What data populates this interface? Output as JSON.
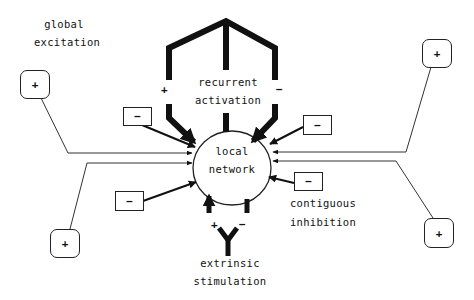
{
  "diagram": {
    "center_node": {
      "line1": "local",
      "line2": "network"
    },
    "recurrent": {
      "line1": "recurrent",
      "line2": "activation",
      "plus_sign": "+",
      "minus_sign": "−"
    },
    "global": {
      "line1": "global",
      "line2": "excitation"
    },
    "contiguous": {
      "line1": "contiguous",
      "line2": "inhibition"
    },
    "extrinsic": {
      "line1": "extrinsic",
      "line2": "stimulation",
      "plus_sign": "+",
      "minus_sign": "−"
    },
    "plus_boxes": [
      {
        "label": "+",
        "position": "top-left"
      },
      {
        "label": "+",
        "position": "bottom-left"
      },
      {
        "label": "+",
        "position": "top-right"
      },
      {
        "label": "+",
        "position": "bottom-right"
      }
    ],
    "minus_boxes": [
      {
        "label": "−",
        "position": "upper-left"
      },
      {
        "label": "−",
        "position": "lower-left"
      },
      {
        "label": "−",
        "position": "upper-right"
      },
      {
        "label": "−",
        "position": "lower-right"
      }
    ],
    "colors": {
      "ink": "#111111",
      "background": "#ffffff"
    }
  }
}
